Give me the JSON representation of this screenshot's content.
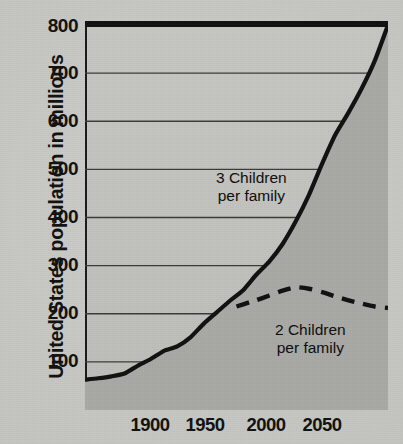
{
  "chart_data": {
    "type": "line",
    "title": "",
    "xlabel": "",
    "ylabel": "United States population in millions",
    "xlim": [
      1870,
      2100
    ],
    "ylim": [
      0,
      800
    ],
    "grid": true,
    "legend_position": "inline-annotations",
    "xticks": [
      1900,
      1950,
      2000,
      2050
    ],
    "yticks": [
      100,
      200,
      300,
      400,
      500,
      600,
      700,
      800
    ],
    "series": [
      {
        "name": "Historical and 3 Children per family",
        "style": "solid",
        "color": "#111111",
        "filled_below": true,
        "x": [
          1870,
          1880,
          1890,
          1900,
          1910,
          1920,
          1930,
          1940,
          1950,
          1960,
          1970,
          1980,
          1990,
          2000,
          2010,
          2020,
          2030,
          2040,
          2050,
          2060,
          2070,
          2080,
          2090,
          2100
        ],
        "y": [
          63,
          66,
          70,
          76,
          92,
          106,
          123,
          132,
          151,
          179,
          203,
          227,
          249,
          281,
          309,
          345,
          392,
          447,
          512,
          572,
          618,
          668,
          726,
          800
        ]
      },
      {
        "name": "2 Children per family",
        "style": "dashed",
        "color": "#111111",
        "filled_below": false,
        "x": [
          1985,
          1995,
          2000,
          2010,
          2020,
          2030,
          2040,
          2050,
          2060,
          2070,
          2080,
          2090,
          2100
        ],
        "y": [
          215,
          224,
          228,
          238,
          248,
          255,
          252,
          245,
          236,
          228,
          221,
          215,
          212
        ]
      }
    ],
    "annotations": [
      {
        "name": "three-children-label",
        "line1": "3 Children",
        "line2": "per family",
        "x": 2005,
        "y": 480
      },
      {
        "name": "two-children-label",
        "line1": "2 Children",
        "line2": "per family",
        "x": 2055,
        "y": 165
      }
    ]
  },
  "axis": {
    "y_title": "United States population in millions",
    "y_labels": [
      "800",
      "700",
      "600",
      "500",
      "400",
      "300",
      "200",
      "100"
    ],
    "x_labels": [
      "1900",
      "1950",
      "2000",
      "2050"
    ]
  },
  "labels": {
    "three_children_line1": "3 Children",
    "three_children_line2": "per family",
    "two_children_line1": "2 Children",
    "two_children_line2": "per family"
  },
  "colors": {
    "ink": "#111111",
    "paper": "#c9c9c6",
    "plot_fill": "#c3c3bf",
    "area_fill": "#a9a9a5",
    "gridline": "#3a3a38"
  }
}
